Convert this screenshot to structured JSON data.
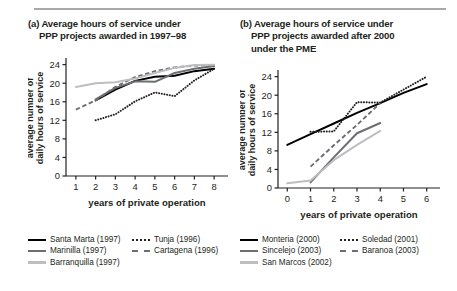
{
  "figure": {
    "panels": [
      {
        "id": "a",
        "title_line1": "(a) Average hours of service under",
        "title_line2": "PPP projects awarded in 1997–98",
        "title_line3": ""
      },
      {
        "id": "b",
        "title_line1": "(b) Average hours of service under",
        "title_line2": "PPP projects awarded after 2000",
        "title_line3": "under the PME"
      }
    ]
  },
  "chart_data": [
    {
      "type": "line",
      "panel": "a",
      "title": "(a) Average hours of service under PPP projects awarded in 1997–98",
      "xlabel": "years of private operation",
      "ylabel": "average number of daily hours of service",
      "xlim": [
        0.5,
        8.5
      ],
      "ylim": [
        0,
        25
      ],
      "xticks": [
        1,
        2,
        3,
        4,
        5,
        6,
        7,
        8
      ],
      "yticks": [
        0,
        4,
        8,
        12,
        16,
        20,
        24
      ],
      "grid": false,
      "legend_position": "below",
      "series": [
        {
          "name": "Santa Marta (1997)",
          "style": "solid",
          "color": "#000000",
          "x": [
            2,
            3,
            4,
            5,
            6,
            7,
            8
          ],
          "values": [
            16.3,
            18.6,
            20.5,
            21.4,
            21.6,
            22.6,
            23.1
          ]
        },
        {
          "name": "Tunja (1996)",
          "style": "dotted",
          "color": "#231f20",
          "x": [
            2,
            3,
            4,
            5,
            6,
            7,
            8
          ],
          "values": [
            12.0,
            13.3,
            16.1,
            18.0,
            17.2,
            20.6,
            23.1
          ]
        },
        {
          "name": "Marinilla (1997)",
          "style": "solid",
          "color": "#6d6e71",
          "x": [
            2,
            3,
            4,
            5,
            6,
            7,
            8
          ],
          "values": [
            16.5,
            19.0,
            20.4,
            20.3,
            22.2,
            23.1,
            23.7
          ]
        },
        {
          "name": "Cartagena (1996)",
          "style": "dashed",
          "color": "#6d6e71",
          "x": [
            1,
            2,
            3,
            4,
            5,
            6,
            7,
            8
          ],
          "values": [
            14.3,
            16.3,
            19.2,
            21.3,
            22.6,
            23.4,
            23.8,
            23.9
          ]
        },
        {
          "name": "Barranquilla (1997)",
          "style": "solid",
          "color": "#bcbec0",
          "x": [
            1,
            2,
            3,
            4,
            5,
            6,
            7,
            8
          ],
          "values": [
            19.2,
            20.0,
            20.2,
            21.0,
            22.2,
            23.3,
            23.9,
            24.0
          ]
        }
      ]
    },
    {
      "type": "line",
      "panel": "b",
      "title": "(b) Average hours of service under PPP projects awarded after 2000 under the PME",
      "xlabel": "years of private operation",
      "ylabel": "average number of daily hours of service",
      "xlim": [
        -0.4,
        6.4
      ],
      "ylim": [
        0,
        25
      ],
      "xticks": [
        0,
        1,
        2,
        3,
        4,
        5,
        6
      ],
      "yticks": [
        0,
        4,
        8,
        12,
        16,
        20,
        24
      ],
      "grid": false,
      "legend_position": "below",
      "series": [
        {
          "name": "Monteria (2000)",
          "style": "solid",
          "color": "#000000",
          "x": [
            0,
            1,
            2,
            3,
            4,
            5,
            6
          ],
          "values": [
            9.3,
            11.6,
            13.9,
            16.2,
            18.3,
            20.5,
            22.4
          ]
        },
        {
          "name": "Soledad (2001)",
          "style": "dotted",
          "color": "#231f20",
          "x": [
            1,
            2,
            3,
            4,
            5,
            6
          ],
          "values": [
            12.1,
            12.2,
            18.5,
            18.4,
            21.2,
            24.0
          ]
        },
        {
          "name": "Sincelejo (2003)",
          "style": "solid",
          "color": "#6d6e71",
          "x": [
            1,
            2,
            3,
            4
          ],
          "values": [
            1.2,
            6.6,
            11.8,
            14.0
          ]
        },
        {
          "name": "Baranoa (2003)",
          "style": "dashed",
          "color": "#6d6e71",
          "x": [
            1,
            2,
            3,
            4
          ],
          "values": [
            4.6,
            9.2,
            13.6,
            18.3
          ]
        },
        {
          "name": "San Marcos (2002)",
          "style": "solid",
          "color": "#bcbec0",
          "x": [
            0,
            1,
            2,
            3,
            4
          ],
          "values": [
            1.0,
            1.6,
            6.0,
            9.3,
            12.3
          ]
        }
      ]
    }
  ],
  "axes": {
    "ylabel_line1": "average number of",
    "ylabel_line2": "daily hours of service",
    "xlabel": "years of private operation",
    "yticks": [
      "0",
      "4",
      "8",
      "12",
      "16",
      "20",
      "24"
    ],
    "xticks_a": [
      "1",
      "2",
      "3",
      "4",
      "5",
      "6",
      "7",
      "8"
    ],
    "xticks_b": [
      "0",
      "1",
      "2",
      "3",
      "4",
      "5",
      "6"
    ]
  },
  "legend_a": {
    "row1": [
      {
        "label": "Santa Marta (1997)",
        "style": "solid",
        "color": "#000000"
      },
      {
        "label": "Tunja (1996)",
        "style": "dotted",
        "color": "#231f20"
      }
    ],
    "row2": [
      {
        "label": "Marinilla (1997)",
        "style": "solid",
        "color": "#6d6e71"
      },
      {
        "label": "Cartagena (1996)",
        "style": "dashed",
        "color": "#6d6e71"
      }
    ],
    "row3": [
      {
        "label": "Barranquilla (1997)",
        "style": "solid",
        "color": "#bcbec0"
      }
    ]
  },
  "legend_b": {
    "row1": [
      {
        "label": "Monteria (2000)",
        "style": "solid",
        "color": "#000000"
      },
      {
        "label": "Soledad (2001)",
        "style": "dotted",
        "color": "#231f20"
      }
    ],
    "row2": [
      {
        "label": "Sincelejo (2003)",
        "style": "solid",
        "color": "#6d6e71"
      },
      {
        "label": "Baranoa (2003)",
        "style": "dashed",
        "color": "#6d6e71"
      }
    ],
    "row3": [
      {
        "label": "San Marcos (2002)",
        "style": "solid",
        "color": "#bcbec0"
      }
    ]
  }
}
